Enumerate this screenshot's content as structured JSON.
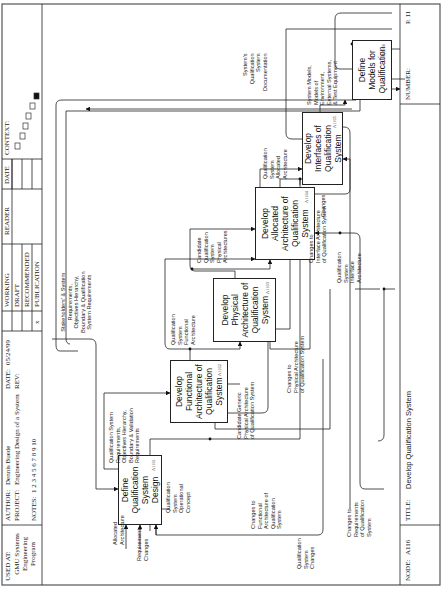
{
  "header": {
    "used_at_label": "USED AT:",
    "used_at_value": "GMU Systems\nEngineering\nProgram",
    "author_label": "AUTHOR:",
    "author_value": "Dennis Buede",
    "project_label": "PROJECT:",
    "project_value": "Engineering Design of a System",
    "notes_label": "NOTES:",
    "notes_value": "1  2  3  4  5  6  7  8  9  10",
    "date_label": "DATE:",
    "date_value": "05/24/99",
    "rev_label": "REV:",
    "rev_value": "",
    "status": {
      "working": "WORKING",
      "draft": "DRAFT",
      "recommended": "RECOMMENDED",
      "publication": "PUBLICATION",
      "publication_mark": "x"
    },
    "reader_label": "READER",
    "date2_label": "DATE",
    "context_label": "CONTEXT:"
  },
  "footer": {
    "node_label": "NODE:",
    "node_value": "A116",
    "title_label": "TITLE:",
    "title_value": "Develop Qualification System",
    "number_label": "NUMBER:",
    "number_value": "P. 11"
  },
  "boxes": [
    {
      "label": "Define\nQualification\nSystem\nDesign",
      "id": "A1161"
    },
    {
      "label": "Develop\nFunctional\nArchitecture of\nQualification\nSystem",
      "id": "A1162"
    },
    {
      "label": "Develop\nPhysical\nArchitecture of\nQualification\nSystem",
      "id": "A1163"
    },
    {
      "label": "Develop\nAllocated\nArchitecture of\nQualification\nSystem",
      "id": "A1164"
    },
    {
      "label": "Develop\nInterfaces of\nQualification\nSystem",
      "id": "A1165"
    },
    {
      "label": "Define\nModels for\nQualification",
      "id": "A1166"
    }
  ],
  "arrow_labels": {
    "stakeholders": "Stakeholders' & System\nRequirements,\nObjectives Hierarchy,\nBoundary & Qualification\nSystem Requirements",
    "qual_sys_reqs": "Qualification System\nRequirements,\nObjectives Hierarchy,\nBoundary & Validation\nRequirements",
    "qual_func_arch": "Qualification\nSystem\nFunctional\nArchitecture",
    "candidate_phys": "Candidate\nQualification\nSystem\nPhysical\nArchitectures",
    "qual_alloc_arch": "Qualification\nSystem\nAllocated\nArchitecture",
    "system_models": "System Models,\nModels of\nEnvironment,\nExternal Systems,\n& Test Equipment",
    "sys_qual_doc": "System's\nQualification\nSystem\nDocumentation",
    "allocated_arch": "Allocated\nArchitecture",
    "requirement_changes": "Requirement\nChanges",
    "qual_op_concept": "Qualification\nSystem\nOperational\nConcept",
    "changes_func": "Changes to\nFunctional\nArchitecture of\nQualification\nSystem",
    "candidate_generic": "Candidate Generic\nPhysical Architecture\nof Qualification System",
    "changes_phys": "Changes to\nPhysical Architecture\nof Qualification System",
    "qual_sys_changes": "Qualification\nSystem\nChanges",
    "changes_reqs": "Changes to\nRequirements\nof Qualification\nSystem",
    "qual_interface_arch": "Qualification\nSystem\nInterface\nArchitecture",
    "changes_interface": "Changes to\nInterface Architecture\nof Qualification System",
    "changes": "Changes"
  },
  "colors": {
    "line": "#222222",
    "frame": "#555555",
    "background": "#ffffff"
  }
}
